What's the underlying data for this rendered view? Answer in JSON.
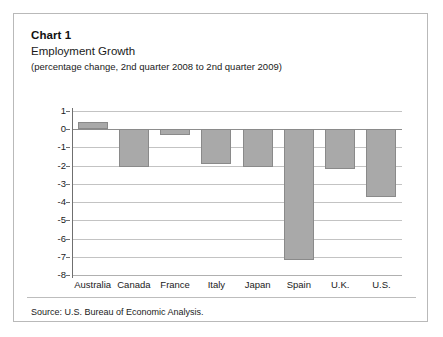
{
  "card": {
    "chart_number": "Chart 1",
    "source_note": "Source: U.S. Bureau of Economic Analysis."
  },
  "chart_data": {
    "type": "bar",
    "title": "Employment Growth",
    "subtitle": "(percentage change, 2nd quarter 2008 to 2nd quarter 2009)",
    "xlabel": "",
    "ylabel": "",
    "ylim": [
      -8,
      1
    ],
    "yticks": [
      1,
      0,
      -1,
      -2,
      -3,
      -4,
      -5,
      -6,
      -7,
      -8
    ],
    "ytick_labels": [
      "1",
      "0",
      "-1",
      "-2",
      "-3",
      "-4",
      "-5",
      "-6",
      "-7",
      "-8"
    ],
    "grid": true,
    "legend": "none",
    "bar_color": "#a9a9a9",
    "bar_edge_color": "#8a8a8a",
    "categories": [
      "Australia",
      "Canada",
      "France",
      "Italy",
      "Japan",
      "Spain",
      "U.K.",
      "U.S."
    ],
    "values": [
      0.4,
      -2.1,
      -0.3,
      -1.9,
      -2.1,
      -7.2,
      -2.2,
      -3.7
    ]
  }
}
